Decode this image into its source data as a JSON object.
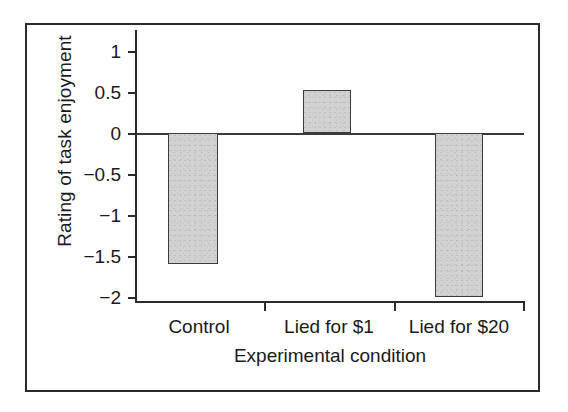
{
  "figure": {
    "frame_color": "#2b2b2b",
    "background": "#ffffff"
  },
  "chart_data": {
    "type": "bar",
    "title": "",
    "categories": [
      "Control",
      "Lied for $1",
      "Lied for $20"
    ],
    "values": [
      -1.6,
      0.52,
      -2.0
    ],
    "xlabel": "Experimental condition",
    "ylabel": "Rating of task enjoyment",
    "ylim": [
      -2.25,
      1.0
    ],
    "yticks": [
      1,
      0.5,
      0,
      -0.5,
      -1,
      -1.5,
      -2
    ],
    "ytick_labels": [
      "1",
      "0.5",
      "0",
      "−0.5",
      "−1",
      "−1.5",
      "−2"
    ],
    "grid": false,
    "legend": null,
    "zero_line": true,
    "bar_fill_color": "#d2d2d2",
    "bar_edge_color": "#3c3c3c",
    "axis_color": "#2b2b2b",
    "series": [
      {
        "name": "Rating of task enjoyment",
        "values": [
          -1.6,
          0.52,
          -2.0
        ]
      }
    ]
  },
  "axis": {
    "y_title": "Rating of task enjoyment",
    "x_title": "Experimental condition",
    "y_tick_labels": [
      "1",
      "0.5",
      "0",
      "−0.5",
      "−1",
      "−1.5",
      "−2"
    ],
    "x_tick_labels": [
      "Control",
      "Lied for $1",
      "Lied for $20"
    ]
  }
}
